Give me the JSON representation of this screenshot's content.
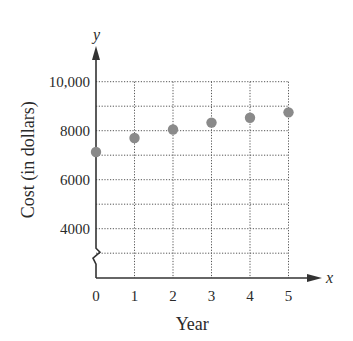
{
  "chart_data": {
    "type": "scatter",
    "title": "",
    "xlabel": "Year",
    "ylabel": "Cost (in dollars)",
    "x_axis_var": "x",
    "y_axis_var": "y",
    "x": [
      0,
      1,
      2,
      3,
      4,
      5
    ],
    "values": [
      7130,
      7700,
      8050,
      8330,
      8530,
      8750
    ],
    "x_ticks": [
      "0",
      "1",
      "2",
      "3",
      "4",
      "5"
    ],
    "y_ticks": [
      "4000",
      "6000",
      "8000",
      "10,000"
    ],
    "xlim": [
      0,
      5
    ],
    "ylim": [
      3000,
      10000
    ],
    "grid": true,
    "grid_style": "dotted",
    "y_axis_break": true,
    "marker_color": "#8a8a8a"
  }
}
